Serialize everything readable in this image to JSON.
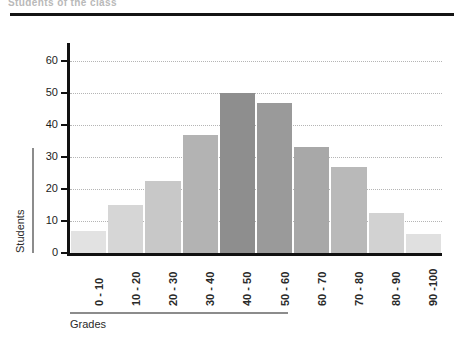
{
  "caption": {
    "truncated_heading": "Students  of  the  class"
  },
  "chart_data": {
    "type": "bar",
    "title": "",
    "xlabel": "Grades",
    "ylabel": "Students",
    "categories": [
      "0 - 10",
      "10 - 20",
      "20 - 30",
      "30 - 40",
      "40 - 50",
      "50 - 60",
      "60 - 70",
      "70 - 80",
      "80 - 90",
      "90 -100"
    ],
    "values": [
      7,
      15,
      22.5,
      37,
      50,
      47,
      33,
      27,
      12.5,
      6
    ],
    "bar_colors": [
      "#e2e2e2",
      "#d6d6d6",
      "#c8c8c8",
      "#b3b3b3",
      "#8e8e8e",
      "#9a9a9a",
      "#a8a8a8",
      "#b9b9b9",
      "#d2d2d2",
      "#e0e0e0"
    ],
    "ylim": [
      0,
      65
    ],
    "yticks": [
      0,
      10,
      20,
      30,
      40,
      50,
      60
    ],
    "ytick_labels": [
      "0",
      "10",
      "20",
      "30",
      "40",
      "50",
      "60"
    ],
    "grid": true,
    "grid_color": "#b5b5b5",
    "legend": "none",
    "axis_color": "#111111"
  }
}
